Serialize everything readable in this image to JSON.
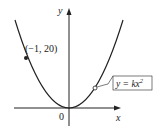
{
  "diagram": {
    "type": "function-graph",
    "axes": {
      "x_label": "x",
      "y_label": "y",
      "origin_label": "0"
    },
    "curve": {
      "equation_label_lhs": "y = kx",
      "equation_label_exp": "2",
      "shape": "upward parabola through origin"
    },
    "point": {
      "label": "(−1, 20)",
      "x": -1,
      "y": 20
    },
    "colors": {
      "stroke": "#222222",
      "background": "#ffffff"
    }
  }
}
